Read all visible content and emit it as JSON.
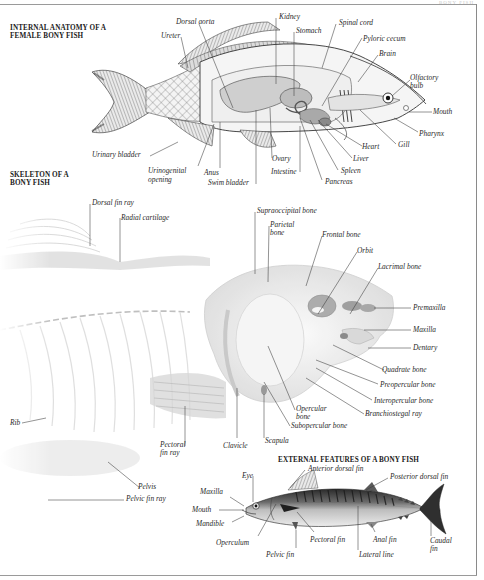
{
  "corner_tag": "BONY FISH",
  "sections": {
    "internal": {
      "title_line1": "INTERNAL ANATOMY OF A",
      "title_line2": "FEMALE BONY FISH",
      "labels": {
        "dorsal_aorta": "Dorsal aorta",
        "ureter": "Ureter",
        "kidney": "Kidney",
        "stomach": "Stomach",
        "spinal_cord": "Spinal cord",
        "pyloric_cecum": "Pyloric cecum",
        "brain": "Brain",
        "olfactory_bulb_1": "Olfactory",
        "olfactory_bulb_2": "bulb",
        "mouth": "Mouth",
        "pharynx": "Pharynx",
        "gill": "Gill",
        "heart": "Heart",
        "liver": "Liver",
        "spleen": "Spleen",
        "pancreas": "Pancreas",
        "intestine": "Intestine",
        "ovary": "Ovary",
        "swim_bladder": "Swim bladder",
        "anus": "Anus",
        "urinogenital_1": "Urinogenital",
        "urinogenital_2": "opening",
        "urinary_bladder": "Urinary bladder"
      }
    },
    "skeleton": {
      "title_line1": "SKELETON OF A",
      "title_line2": "BONY FISH",
      "labels": {
        "dorsal_fin_ray": "Dorsal fin ray",
        "radial_cartilage": "Radial cartilage",
        "supraoccipital_bone": "Supraoccipital bone",
        "parietal_1": "Parietal",
        "parietal_2": "bone",
        "frontal_bone": "Frontal bone",
        "orbit": "Orbit",
        "lacrimal_bone": "Lacrimal bone",
        "premaxilla": "Premaxilla",
        "maxilla": "Maxilla",
        "dentary": "Dentary",
        "quadrate_bone": "Quadrate bone",
        "preopercular_bone": "Preopercular bone",
        "interopercular_bone": "Interopercular bone",
        "branchiostegal_ray": "Branchiostegal ray",
        "opercular_1": "Opercular",
        "opercular_2": "bone",
        "subopercular_bone": "Subopercular bone",
        "scapula": "Scapula",
        "clavicle": "Clavicle",
        "pectoral_fin_ray_1": "Pectoral",
        "pectoral_fin_ray_2": "fin ray",
        "rib": "Rib",
        "pelvis": "Pelvis",
        "pelvic_fin_ray": "Pelvic fin ray"
      }
    },
    "external": {
      "title": "EXTERNAL FEATURES OF A BONY FISH",
      "labels": {
        "anterior_dorsal_fin": "Anterior dorsal fin",
        "posterior_dorsal_fin": "Posterior dorsal fin",
        "eye": "Eye",
        "maxilla": "Maxilla",
        "mouth": "Mouth",
        "mandible": "Mandible",
        "operculum": "Operculum",
        "pelvic_fin": "Pelvic fin",
        "pectoral_fin": "Pectoral fin",
        "lateral_line": "Lateral line",
        "anal_fin": "Anal fin",
        "caudal_fin_1": "Caudal",
        "caudal_fin_2": "fin"
      }
    }
  }
}
